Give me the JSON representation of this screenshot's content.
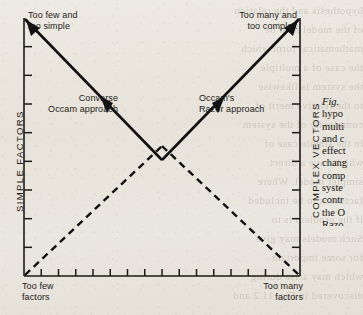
{
  "figure": {
    "corner_labels": {
      "top_left": "Too few and\ntoo simple",
      "top_right": "Too many and\ntoo complex",
      "bottom_left": "Too few\nfactors",
      "bottom_right": "Too many\nfactors"
    },
    "axis_titles": {
      "left": "SIMPLE  FACTORS",
      "right": "COMPLEX  VECTORS"
    },
    "annotations": [
      {
        "name": "converse-occam",
        "text": "Converse\nOccam approach"
      },
      {
        "name": "occams-razor",
        "text": "Occam's\nRazor approach"
      }
    ]
  },
  "caption": {
    "fig_label": "Fig.",
    "fig_number": " ",
    "lines": [
      "hypo",
      "multi",
      "and c",
      "effect",
      "chang",
      "comp",
      "syste",
      "contr",
      "the O",
      "Razo",
      "Conv",
      "Occa",
      "quali"
    ]
  },
  "bleed_through": {
    "lines": [
      "hypothesis and the relation",
      "of the model is to be",
      "mathematical form which",
      "the case of a multiple",
      "the system is likewise",
      "to the relative merit of",
      "complexity of the system",
      "in the simple case of",
      "which have a direct",
      "simpler model. Where",
      "factors is to be included",
      "if the problem is to",
      "Such models may give",
      "for some important",
      "which may arise during",
      "discovered in Fig. 11.2 and"
    ]
  },
  "colors": {
    "ink": "#1d1b18",
    "paper": "#e9e6df",
    "bleed": "#b9b4aa"
  },
  "chart_data": {
    "type": "line",
    "title": "",
    "xlabel": "",
    "ylabel": "",
    "xlim": [
      0,
      100
    ],
    "ylim": [
      0,
      100
    ],
    "grid": false,
    "legend": "none",
    "series": [
      {
        "name": "Converse Occam approach",
        "style": "solid",
        "arrow_at": {
          "x": 33,
          "y": 61
        },
        "points": [
          {
            "x": 0,
            "y": 100
          },
          {
            "x": 50,
            "y": 0
          }
        ]
      },
      {
        "name": "Occam's Razor approach",
        "style": "solid",
        "arrow_at": {
          "x": 67,
          "y": 61
        },
        "points": [
          {
            "x": 50,
            "y": 0
          },
          {
            "x": 100,
            "y": 100
          }
        ]
      },
      {
        "name": "lower-left dashed",
        "style": "dashed",
        "points": [
          {
            "x": 0,
            "y": 0
          },
          {
            "x": 50,
            "y": 52
          }
        ]
      },
      {
        "name": "lower-right dashed",
        "style": "dashed",
        "points": [
          {
            "x": 50,
            "y": 52
          },
          {
            "x": 100,
            "y": 0
          }
        ]
      }
    ],
    "x_ticks": 15,
    "y_ticks_left": 8,
    "y_ticks_right": 8
  }
}
